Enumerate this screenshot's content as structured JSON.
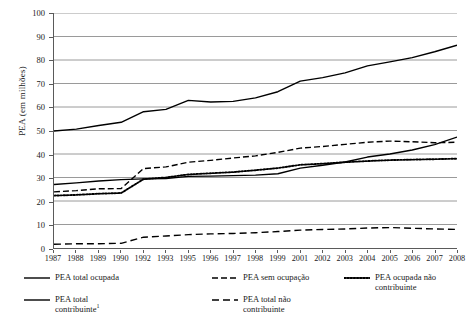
{
  "chart_data": {
    "type": "line",
    "title": "",
    "xlabel": "",
    "ylabel": "PEA (em milhões)",
    "ylim": [
      0,
      100
    ],
    "ytick_step": 10,
    "yticks": [
      0,
      10,
      20,
      30,
      40,
      50,
      60,
      70,
      80,
      90,
      100
    ],
    "grid": true,
    "grid_color": "#808080",
    "legend_position": "bottom",
    "categories": [
      "1987",
      "1988",
      "1989",
      "1990",
      "1992",
      "1993",
      "1995",
      "1996",
      "1997",
      "1998",
      "1999",
      "2001",
      "2002",
      "2003",
      "2004",
      "2005",
      "2006",
      "2007",
      "2008"
    ],
    "series": [
      {
        "name": "PEA total ocupada",
        "style": "solid",
        "color": "#000000",
        "values": [
          49.8,
          50.6,
          52.1,
          53.5,
          58.0,
          59.0,
          62.8,
          62.1,
          62.4,
          63.9,
          66.5,
          71.0,
          72.5,
          74.5,
          77.5,
          79.2,
          81.0,
          83.5,
          86.3
        ]
      },
      {
        "name": "PEA sem ocupação",
        "style": "dashed",
        "color": "#000000",
        "values": [
          23.9,
          24.4,
          25.2,
          25.3,
          33.8,
          34.5,
          36.5,
          37.3,
          38.3,
          39.2,
          40.7,
          42.5,
          43.2,
          44.1,
          45.0,
          45.5,
          45.2,
          44.8,
          45.0
        ]
      },
      {
        "name": "PEA ocupada não contribuinte",
        "style": "dotted",
        "color": "#000000",
        "values": [
          22.3,
          22.6,
          23.1,
          23.4,
          29.3,
          30.0,
          31.3,
          31.8,
          32.3,
          33.1,
          34.0,
          35.4,
          35.9,
          36.5,
          37.0,
          37.4,
          37.6,
          37.8,
          38.0
        ]
      },
      {
        "name": "PEA total contribuinte",
        "style": "solid",
        "color": "#000000",
        "values": [
          27.0,
          27.7,
          28.5,
          29.1,
          29.4,
          29.6,
          30.5,
          30.6,
          30.8,
          31.0,
          31.6,
          34.0,
          35.2,
          36.6,
          38.7,
          40.0,
          41.7,
          44.0,
          47.2
        ]
      },
      {
        "name": "PEA total não contribuinte",
        "style": "dashed-long",
        "color": "#000000",
        "values": [
          1.6,
          1.8,
          1.8,
          2.0,
          4.6,
          5.1,
          5.7,
          6.0,
          6.2,
          6.5,
          7.0,
          7.6,
          7.9,
          8.1,
          8.5,
          8.7,
          8.4,
          8.1,
          7.9
        ]
      }
    ]
  },
  "yaxis": {
    "title": "PEA (em milhões)",
    "ticks": [
      "100",
      "90",
      "80",
      "70",
      "60",
      "50",
      "40",
      "30",
      "20",
      "10",
      "0"
    ]
  },
  "xaxis": {
    "ticks": [
      "1987",
      "1988",
      "1989",
      "1990",
      "1992",
      "1993",
      "1995",
      "1996",
      "1997",
      "1998",
      "1999",
      "2001",
      "2002",
      "2003",
      "2004",
      "2005",
      "2006",
      "2007",
      "2008"
    ]
  },
  "legend": {
    "entries": [
      {
        "label": "PEA total ocupada",
        "style": "solid",
        "col": 0,
        "row": 0
      },
      {
        "label": "PEA total\ncontribuinte",
        "superscript": "1",
        "style": "solid",
        "col": 0,
        "row": 1
      },
      {
        "label": "PEA sem ocupação",
        "style": "dashed",
        "col": 1,
        "row": 0
      },
      {
        "label": "PEA total não\ncontribuinte",
        "style": "dashed-long",
        "col": 1,
        "row": 1
      },
      {
        "label": "PEA ocupada não\ncontribuinte",
        "style": "dotted",
        "col": 2,
        "row": 0
      }
    ]
  }
}
